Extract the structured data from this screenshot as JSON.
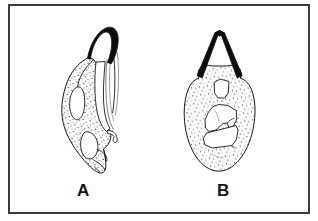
{
  "figure": {
    "kind": "scientific-line-drawing",
    "background_color": "#ffffff",
    "frame_color": "#3b3b3b",
    "ink_color": "#141414",
    "stipple_color": "#1a1a1a",
    "panels": [
      {
        "label": "A",
        "view": "lateral",
        "description": "Elongate stippled structure with dark curved apical hook, internal sclerites outlined, sub-apical notch at lower right",
        "apex_fill": "#0d0d0d",
        "label_x": 77,
        "label_y": 182
      },
      {
        "label": "B",
        "view": "ventral",
        "description": "Broadly oval stippled structure with dark inverted-V apical arms and three internal sclerite plates",
        "apex_fill": "#0d0d0d",
        "label_x": 217,
        "label_y": 182
      }
    ],
    "frame": {
      "x": 8,
      "y": 4,
      "width": 302,
      "height": 210,
      "stroke_width": 2
    }
  }
}
